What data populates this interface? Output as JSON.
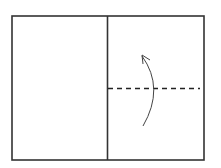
{
  "diagram": {
    "type": "fold-instruction",
    "stroke_color": "#333333",
    "background": "#ffffff",
    "outer_rect": {
      "x": 12,
      "y": 16,
      "w": 192,
      "h": 144
    },
    "divider": {
      "x": 107
    },
    "fold_line": {
      "style": "dashed",
      "x1": 107,
      "x2": 200,
      "y": 88
    },
    "arrow": {
      "direction": "up",
      "path": "M143 126 Q165 88 142 56",
      "tip": {
        "x": 142,
        "y": 56
      }
    }
  }
}
